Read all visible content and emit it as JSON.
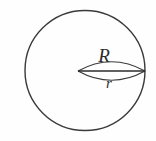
{
  "figure": {
    "background_color": "#fefefe",
    "stroke_color": "#3a3a3a",
    "label_color": "#2b2b2b",
    "labels": {
      "major_radius": "R",
      "minor_radius": "r"
    },
    "shapes": {
      "outer_circle": {
        "name": "outer-circle",
        "center_x": 85,
        "center_y": 70.5,
        "radius": 60,
        "stroke_width": 1.4
      },
      "lens": {
        "name": "inner-lens",
        "left_vertex_x": 78,
        "right_vertex_x": 145,
        "axis_y": 71,
        "top_bulge_y": 59,
        "bottom_bulge_y": 83,
        "stroke_width": 1.2
      },
      "axis_line": {
        "name": "lens-axis-line",
        "x1": 78,
        "y1": 71,
        "x2": 145,
        "y2": 71,
        "stroke_width": 1.5
      }
    },
    "label_positions": {
      "major_radius": {
        "x": 104,
        "y": 62
      },
      "minor_radius": {
        "x": 105,
        "y": 88
      }
    }
  }
}
